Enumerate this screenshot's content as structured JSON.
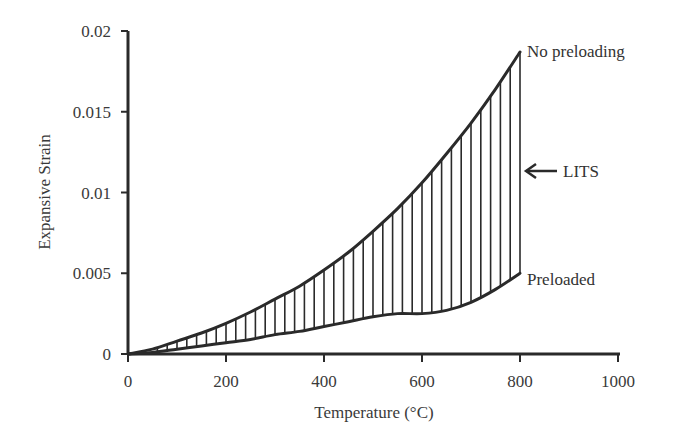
{
  "chart_data": {
    "type": "line",
    "title": "",
    "xlabel": "Temperature (°C)",
    "ylabel": "Expansive Strain",
    "xlim": [
      0,
      1000
    ],
    "ylim": [
      0,
      0.02
    ],
    "xticks": [
      0,
      200,
      400,
      600,
      800,
      1000
    ],
    "yticks": [
      0,
      0.005,
      0.01,
      0.015,
      0.02
    ],
    "xtick_labels": [
      "0",
      "200",
      "400",
      "600",
      "800",
      "1000"
    ],
    "ytick_labels": [
      "0",
      "0.005",
      "0.01",
      "0.015",
      "0.02"
    ],
    "grid": false,
    "legend": "none (direct labels)",
    "series": [
      {
        "name": "No preloading",
        "x": [
          0,
          50,
          100,
          150,
          200,
          250,
          300,
          350,
          400,
          450,
          500,
          550,
          600,
          650,
          700,
          750,
          800
        ],
        "y": [
          0,
          0.0003,
          0.0008,
          0.0013,
          0.0019,
          0.0026,
          0.0034,
          0.0042,
          0.0052,
          0.0063,
          0.0076,
          0.009,
          0.0106,
          0.0124,
          0.0143,
          0.0164,
          0.0187
        ]
      },
      {
        "name": "Preloaded",
        "x": [
          0,
          50,
          100,
          150,
          200,
          250,
          300,
          350,
          400,
          450,
          500,
          550,
          600,
          650,
          700,
          750,
          800
        ],
        "y": [
          0,
          0.0001,
          0.0003,
          0.0005,
          0.0007,
          0.0009,
          0.0012,
          0.0014,
          0.0017,
          0.002,
          0.0023,
          0.0025,
          0.0025,
          0.0027,
          0.0032,
          0.004,
          0.005
        ]
      }
    ],
    "annotations": [
      {
        "text": "No preloading",
        "x": 800,
        "y": 0.0187
      },
      {
        "text": "Preloaded",
        "x": 800,
        "y": 0.005
      },
      {
        "text": "LITS",
        "x": 800,
        "y": 0.011,
        "arrow": "left",
        "note": "vertical hatching between the curves denotes LITS"
      }
    ],
    "hatch_step": 20,
    "colors": {
      "line": "#2a2a2a",
      "hatch": "#2a2a2a",
      "text": "#333333"
    }
  }
}
